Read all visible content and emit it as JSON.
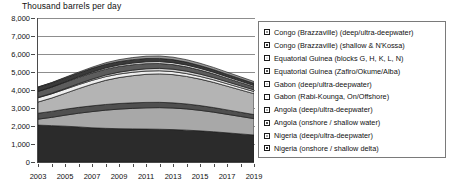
{
  "chart_data": {
    "type": "area",
    "stacked": true,
    "title": "Thousand barrels per day",
    "xlabel": "",
    "ylabel": "Thousand barrels per day",
    "ylim": [
      0,
      8000
    ],
    "ytick_values": [
      0,
      1000,
      2000,
      3000,
      4000,
      5000,
      6000,
      7000,
      8000
    ],
    "ytick_labels": [
      "0",
      "1,000",
      "2,000",
      "3,000",
      "4,000",
      "5,000",
      "6,000",
      "7,000",
      "8,000"
    ],
    "grid": true,
    "grid_axis": "y",
    "legend_position": "right",
    "x": [
      2003,
      2004,
      2005,
      2006,
      2007,
      2008,
      2009,
      2010,
      2011,
      2012,
      2013,
      2014,
      2015,
      2016,
      2017,
      2018,
      2019
    ],
    "xtick_labels": [
      "2003",
      "2005",
      "2007",
      "2009",
      "2011",
      "2013",
      "2015",
      "2017",
      "2019"
    ],
    "xtick_values": [
      2003,
      2005,
      2007,
      2009,
      2011,
      2013,
      2015,
      2017,
      2019
    ],
    "series": [
      {
        "name": "Nigeria (onshore / shallow delta)",
        "color": "#2b2b2b",
        "values": [
          2050,
          2020,
          1990,
          1950,
          1900,
          1870,
          1850,
          1840,
          1830,
          1820,
          1800,
          1770,
          1730,
          1680,
          1620,
          1560,
          1500
        ]
      },
      {
        "name": "Nigeria (deep/ultra-deepwater)",
        "color": "#a8a8a8",
        "values": [
          330,
          460,
          610,
          760,
          900,
          1010,
          1090,
          1140,
          1180,
          1200,
          1200,
          1180,
          1140,
          1090,
          1030,
          970,
          910
        ]
      },
      {
        "name": "Angola (onshore / shallow water)",
        "color": "#4f4f4f",
        "values": [
          330,
          330,
          330,
          325,
          320,
          315,
          310,
          305,
          300,
          295,
          285,
          275,
          265,
          255,
          245,
          235,
          225
        ]
      },
      {
        "name": "Angola (deep/ultra-deepwater)",
        "color": "#b4b4b4",
        "values": [
          620,
          740,
          880,
          1040,
          1200,
          1340,
          1440,
          1510,
          1560,
          1580,
          1570,
          1530,
          1470,
          1400,
          1320,
          1240,
          1160
        ]
      },
      {
        "name": "Gabon (Rabi-Kounga, On/Offshore)",
        "color": "#efefef",
        "values": [
          240,
          235,
          230,
          222,
          214,
          206,
          198,
          190,
          182,
          174,
          166,
          158,
          150,
          142,
          134,
          126,
          118
        ]
      },
      {
        "name": "Gabon (deep/ultra-deepwater)",
        "color": "#d4d4d4",
        "values": [
          20,
          28,
          38,
          52,
          70,
          88,
          104,
          118,
          128,
          134,
          136,
          134,
          128,
          120,
          112,
          104,
          96
        ]
      },
      {
        "name": "Equatorial Guinea (Zafiro/Okume/Alba)",
        "color": "#5c5c5c",
        "values": [
          330,
          340,
          350,
          350,
          340,
          330,
          315,
          300,
          285,
          270,
          255,
          240,
          225,
          210,
          195,
          182,
          170
        ]
      },
      {
        "name": "Equatorial Guinea (blocks G, H, K, L, N)",
        "color": "#e4e4e4",
        "values": [
          10,
          16,
          24,
          36,
          52,
          68,
          82,
          94,
          102,
          106,
          106,
          102,
          96,
          90,
          84,
          78,
          72
        ]
      },
      {
        "name": "Congo (Brazzaville) (shallow & N'Kossa)",
        "color": "#3a3a3a",
        "values": [
          225,
          222,
          218,
          212,
          206,
          200,
          194,
          188,
          182,
          176,
          170,
          162,
          154,
          146,
          138,
          130,
          122
        ]
      },
      {
        "name": "Congo (Brazzaville) (deep/ultra-deepwater)",
        "color": "#9a9a9a",
        "values": [
          15,
          22,
          32,
          46,
          64,
          84,
          102,
          116,
          128,
          134,
          136,
          134,
          128,
          122,
          114,
          106,
          98
        ]
      }
    ],
    "totals": [
      4170,
      4413,
      4702,
      4993,
      5266,
      5511,
      5685,
      5801,
      5867,
      5889,
      5824,
      5685,
      5486,
      5255,
      4992,
      4731,
      4471
    ],
    "annotations": []
  },
  "legend": {
    "items": [
      {
        "label": "Congo (Brazzaville) (deep/ultra-deepwater)",
        "color": "#9a9a9a"
      },
      {
        "label": "Congo (Brazzaville) (shallow & N'Kossa)",
        "color": "#3a3a3a"
      },
      {
        "label": "Equatorial Guinea (blocks G, H, K, L, N)",
        "color": "#e4e4e4"
      },
      {
        "label": "Equatorial Guinea (Zafiro/Okume/Alba)",
        "color": "#5c5c5c"
      },
      {
        "label": "Gabon (deep/ultra-deepwater)",
        "color": "#d4d4d4"
      },
      {
        "label": "Gabon (Rabi-Kounga, On/Offshore)",
        "color": "#efefef"
      },
      {
        "label": "Angola (deep/ultra-deepwater)",
        "color": "#b4b4b4"
      },
      {
        "label": "Angola (onshore / shallow water)",
        "color": "#4f4f4f"
      },
      {
        "label": "Nigeria (deep/ultra-deepwater)",
        "color": "#a8a8a8"
      },
      {
        "label": "Nigeria (onshore / shallow delta)",
        "color": "#2b2b2b"
      }
    ]
  }
}
